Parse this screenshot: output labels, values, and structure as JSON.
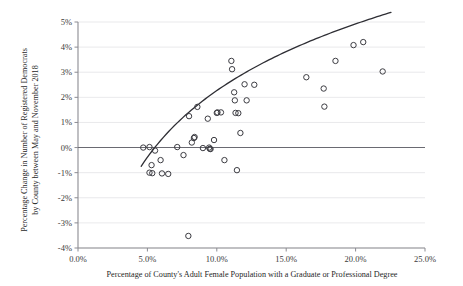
{
  "chart_data": {
    "type": "scatter",
    "title": "",
    "xlabel": "Percentage of County's Adult Female Population with a Graduate or Professional Degree",
    "ylabel": "Percentage Change in Number of Registered Democrats by County between May and November 2018",
    "ylabel_line1": "Percentage Change in Number of Registered Democrats",
    "ylabel_line2": "by County between May and November 2018",
    "xlim": [
      0,
      25
    ],
    "ylim": [
      -4,
      5
    ],
    "xticks": [
      0,
      5,
      10,
      15,
      20,
      25
    ],
    "yticks": [
      -4,
      -3,
      -2,
      -1,
      0,
      1,
      2,
      3,
      4,
      5
    ],
    "xticklabels": [
      "0.0%",
      "5.0%",
      "10.0%",
      "15.0%",
      "20.0%",
      "25.0%"
    ],
    "yticklabels": [
      "-4%",
      "-3%",
      "-2%",
      "-1%",
      "0%",
      "1%",
      "2%",
      "3%",
      "4%",
      "5%"
    ],
    "grid": "horizontal",
    "legend": "none",
    "marker_style": "open-circle",
    "x": [
      4.7,
      5.15,
      5.3,
      5.15,
      5.35,
      5.55,
      5.95,
      6.05,
      6.5,
      7.15,
      7.6,
      7.95,
      8.0,
      8.2,
      8.35,
      8.4,
      8.6,
      9.0,
      9.35,
      9.45,
      9.5,
      9.55,
      9.8,
      10.0,
      10.05,
      10.3,
      10.55,
      11.05,
      11.1,
      11.25,
      11.3,
      11.35,
      11.45,
      11.55,
      11.7,
      12.0,
      12.15,
      12.7,
      16.45,
      17.7,
      17.75,
      18.55,
      19.85,
      20.55,
      21.95
    ],
    "y": [
      0.0,
      0.02,
      -0.7,
      -1.0,
      -1.02,
      -0.12,
      -0.5,
      -1.03,
      -1.05,
      0.02,
      -0.3,
      -3.52,
      1.25,
      0.2,
      0.38,
      0.42,
      1.62,
      -0.02,
      1.15,
      0.0,
      -0.05,
      -0.06,
      0.3,
      1.38,
      1.4,
      1.4,
      -0.5,
      3.45,
      3.12,
      2.2,
      1.88,
      1.38,
      -0.9,
      1.37,
      0.58,
      2.52,
      1.88,
      2.5,
      2.8,
      2.35,
      1.63,
      3.45,
      4.08,
      4.2,
      3.03
    ],
    "trend": {
      "type": "logarithmic-fit",
      "x_start": 4.55,
      "x_end": 22.55,
      "description": "Concave increasing curve rising from about -1.4% at 4.6% to about 3.5% at 22.5%"
    }
  }
}
